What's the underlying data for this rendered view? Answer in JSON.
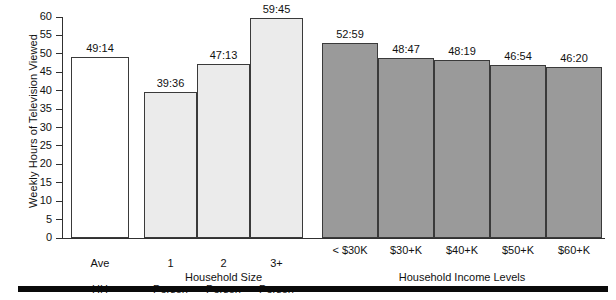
{
  "chart_data": {
    "type": "bar",
    "title": "",
    "xlabel": "",
    "ylabel": "Weekly Hours of Television Viewed",
    "ylim": [
      0,
      60
    ],
    "ytick_step": 5,
    "ytick_labels": [
      "60",
      "55",
      "50",
      "45",
      "40",
      "35",
      "30",
      "25",
      "20",
      "15",
      "10",
      "5",
      "0"
    ],
    "ytick_values": [
      60,
      55,
      50,
      45,
      40,
      35,
      30,
      25,
      20,
      15,
      10,
      5,
      0
    ],
    "grid": false,
    "legend": "none",
    "categories": [
      "Ave\nHH",
      "1\nPerson",
      "2\nPerson",
      "3+\nPerson",
      "< $30K",
      "$30+K",
      "$40+K",
      "$50+K",
      "$60+K"
    ],
    "value_labels": [
      "49:14",
      "39:36",
      "47:13",
      "59:45",
      "52:59",
      "48:47",
      "48:19",
      "46:54",
      "46:20"
    ],
    "values": [
      49.23,
      39.6,
      47.22,
      59.75,
      52.98,
      48.78,
      48.32,
      46.9,
      46.33
    ],
    "groups": [
      {
        "name": "average",
        "label": "",
        "style": "white",
        "bars": [
          {
            "category": "Ave\nHH",
            "label": "49:14",
            "value": 49.23
          }
        ]
      },
      {
        "name": "household-size",
        "label": "Household Size",
        "style": "light",
        "bars": [
          {
            "category": "1\nPerson",
            "label": "39:36",
            "value": 39.6
          },
          {
            "category": "2\nPerson",
            "label": "47:13",
            "value": 47.22
          },
          {
            "category": "3+\nPerson",
            "label": "59:45",
            "value": 59.75
          }
        ]
      },
      {
        "name": "household-income-levels",
        "label": "Household Income Levels",
        "style": "dark",
        "bars": [
          {
            "category": "< $30K",
            "label": "52:59",
            "value": 52.98
          },
          {
            "category": "$30+K",
            "label": "48:47",
            "value": 48.78
          },
          {
            "category": "$40+K",
            "label": "48:19",
            "value": 48.32
          },
          {
            "category": "$50+K",
            "label": "46:54",
            "value": 46.9
          },
          {
            "category": "$60+K",
            "label": "46:20",
            "value": 46.33
          }
        ]
      }
    ]
  },
  "axis": {
    "y_title": "Weekly Hours of Television Viewed",
    "ticks": [
      "60",
      "55",
      "50",
      "45",
      "40",
      "35",
      "30",
      "25",
      "20",
      "15",
      "10",
      "5",
      "0"
    ]
  },
  "group_labels": {
    "household_size": "Household Size",
    "household_income": "Household Income Levels"
  },
  "categories": {
    "ave_hh_line1": "Ave",
    "ave_hh_line2": "HH",
    "p1_line1": "1",
    "p1_line2": "Person",
    "p2_line1": "2",
    "p2_line2": "Person",
    "p3_line1": "3+",
    "p3_line2": "Person",
    "inc1": "< $30K",
    "inc2": "$30+K",
    "inc3": "$40+K",
    "inc4": "$50+K",
    "inc5": "$60+K"
  },
  "values": {
    "ave_hh": "49:14",
    "p1": "39:36",
    "p2": "47:13",
    "p3": "59:45",
    "inc1": "52:59",
    "inc2": "48:47",
    "inc3": "48:19",
    "inc4": "46:54",
    "inc5": "46:20"
  },
  "colors": {
    "bar_white": "#ffffff",
    "bar_light": "#ebebeb",
    "bar_dark": "#9a9a9a",
    "outline": "#3a3a3a",
    "axis": "#303030",
    "rule": "#0a0a0a",
    "text": "#111111"
  }
}
